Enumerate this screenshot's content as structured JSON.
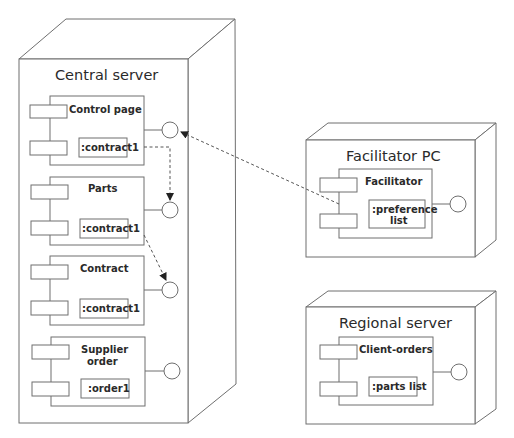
{
  "diagram": {
    "type": "UML deployment diagram",
    "colors": {
      "stroke": "#6f6f6f",
      "text": "#2a2a2a",
      "background": "#ffffff"
    },
    "nodes": [
      {
        "id": "central-server",
        "title": "Central server",
        "components": [
          {
            "id": "control-page",
            "name_lines": [
              "Control page"
            ],
            "artifact_lines": [
              ":contract1"
            ]
          },
          {
            "id": "parts",
            "name_lines": [
              "Parts"
            ],
            "artifact_lines": [
              ":contract1"
            ]
          },
          {
            "id": "contract",
            "name_lines": [
              "Contract"
            ],
            "artifact_lines": [
              ":contract1"
            ]
          },
          {
            "id": "supplier-order",
            "name_lines": [
              "Supplier",
              "order"
            ],
            "artifact_lines": [
              ":order1"
            ]
          }
        ]
      },
      {
        "id": "facilitator-pc",
        "title": "Facilitator PC",
        "components": [
          {
            "id": "facilitator",
            "name_lines": [
              "Facilitator"
            ],
            "artifact_lines": [
              ":preference",
              "list"
            ]
          }
        ]
      },
      {
        "id": "regional-server",
        "title": "Regional server",
        "components": [
          {
            "id": "client-orders",
            "name_lines": [
              "Client-orders"
            ],
            "artifact_lines": [
              ":parts list"
            ]
          }
        ]
      }
    ],
    "dependencies": [
      {
        "from": "facilitator",
        "to": "control-page interface",
        "style": "dashed-arrow"
      },
      {
        "from": "control-page",
        "to": "parts interface",
        "style": "dashed-arrow"
      },
      {
        "from": "parts",
        "to": "contract interface",
        "style": "dashed-arrow"
      }
    ]
  }
}
